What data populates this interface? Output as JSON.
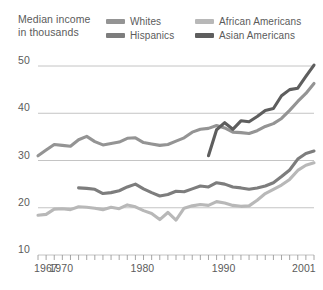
{
  "chart_data": {
    "type": "line",
    "title": "Median income in thousands",
    "title_line1": "Median income",
    "title_line2": "in thousands",
    "xlabel": "",
    "ylabel": "Median income in thousands",
    "xlim": [
      1967,
      2001
    ],
    "ylim": [
      10,
      52
    ],
    "grid": "horizontal",
    "legend_position": "top",
    "y_ticks": [
      10,
      20,
      30,
      40,
      50
    ],
    "x_ticks_labeled": [
      1967,
      1970,
      1980,
      1990,
      2001
    ],
    "x_tick_interval": 1,
    "colors": {
      "whites": "#949494",
      "african_americans": "#b8b8b8",
      "hispanics": "#7d7d7d",
      "asian_americans": "#5e5e5e"
    },
    "series": [
      {
        "name": "Whites",
        "color": "#949494",
        "x": [
          1967,
          1968,
          1969,
          1970,
          1971,
          1972,
          1973,
          1974,
          1975,
          1976,
          1977,
          1978,
          1979,
          1980,
          1981,
          1982,
          1983,
          1984,
          1985,
          1986,
          1987,
          1988,
          1989,
          1990,
          1991,
          1992,
          1993,
          1994,
          1995,
          1996,
          1997,
          1998,
          1999,
          2000,
          2001
        ],
        "values": [
          31.0,
          32.2,
          33.4,
          33.2,
          33.0,
          34.4,
          35.1,
          34.0,
          33.3,
          33.6,
          33.9,
          34.7,
          34.8,
          33.8,
          33.5,
          33.2,
          33.4,
          34.1,
          34.8,
          36.0,
          36.6,
          36.8,
          37.4,
          36.9,
          36.0,
          35.9,
          35.7,
          36.3,
          37.2,
          37.8,
          38.9,
          40.6,
          42.5,
          44.2,
          46.3
        ]
      },
      {
        "name": "African Americans",
        "color": "#b8b8b8",
        "x": [
          1967,
          1968,
          1969,
          1970,
          1971,
          1972,
          1973,
          1974,
          1975,
          1976,
          1977,
          1978,
          1979,
          1980,
          1981,
          1982,
          1983,
          1984,
          1985,
          1986,
          1987,
          1988,
          1989,
          1990,
          1991,
          1992,
          1993,
          1994,
          1995,
          1996,
          1997,
          1998,
          1999,
          2000,
          2001
        ],
        "values": [
          18.4,
          18.6,
          19.7,
          19.8,
          19.6,
          20.2,
          20.1,
          19.9,
          19.6,
          20.1,
          19.8,
          20.6,
          20.2,
          19.4,
          18.8,
          17.5,
          19.0,
          17.4,
          19.9,
          20.4,
          20.7,
          20.5,
          21.3,
          21.0,
          20.5,
          20.3,
          20.4,
          21.6,
          23.0,
          23.9,
          24.8,
          26.0,
          27.9,
          29.0,
          29.5
        ]
      },
      {
        "name": "Hispanics",
        "color": "#7d7d7d",
        "x": [
          1972,
          1973,
          1974,
          1975,
          1976,
          1977,
          1978,
          1979,
          1980,
          1981,
          1982,
          1983,
          1984,
          1985,
          1986,
          1987,
          1988,
          1989,
          1990,
          1991,
          1992,
          1993,
          1994,
          1995,
          1996,
          1997,
          1998,
          1999,
          2000,
          2001
        ],
        "values": [
          24.2,
          24.1,
          23.9,
          23.0,
          23.2,
          23.6,
          24.4,
          25.0,
          24.0,
          23.2,
          22.5,
          22.8,
          23.5,
          23.4,
          24.0,
          24.6,
          24.4,
          25.3,
          25.0,
          24.4,
          24.2,
          23.9,
          24.2,
          24.6,
          25.3,
          26.6,
          28.0,
          30.3,
          31.5,
          32.0
        ]
      },
      {
        "name": "Asian Americans",
        "color": "#5e5e5e",
        "x": [
          1988,
          1989,
          1990,
          1991,
          1992,
          1993,
          1994,
          1995,
          1996,
          1997,
          1998,
          1999,
          2000,
          2001
        ],
        "values": [
          31.0,
          36.5,
          38.0,
          36.6,
          38.4,
          38.2,
          39.3,
          40.6,
          41.0,
          43.7,
          45.0,
          45.3,
          47.8,
          50.2
        ]
      }
    ]
  },
  "legend": {
    "items": [
      {
        "label": "Whites",
        "color": "#949494"
      },
      {
        "label": "African Americans",
        "color": "#b8b8b8"
      },
      {
        "label": "Hispanics",
        "color": "#7d7d7d"
      },
      {
        "label": "Asian Americans",
        "color": "#5e5e5e"
      }
    ]
  },
  "axis": {
    "y_tick_labels": [
      "50",
      "40",
      "30",
      "20",
      "10"
    ],
    "x_tick_labels": [
      "1967",
      "1970",
      "1980",
      "1990",
      "2001"
    ]
  }
}
